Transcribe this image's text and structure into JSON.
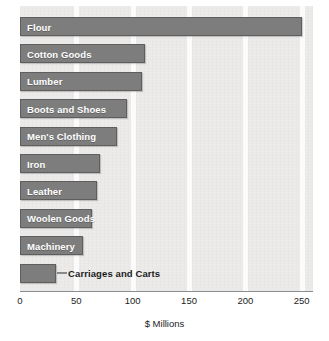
{
  "chart_data": {
    "type": "bar",
    "orientation": "horizontal",
    "title": "",
    "xlabel": "$ Millions",
    "ylabel": "",
    "xlim": [
      0,
      260
    ],
    "xticks": [
      0,
      50,
      100,
      150,
      200,
      250
    ],
    "xtick_labels": [
      "0",
      "50",
      "100",
      "150",
      "200",
      "250"
    ],
    "grid": true,
    "grid_axis": "x",
    "legend": "none",
    "bar_color": "#7d7d7d",
    "bar_border_color": "#5e5e5e",
    "plot_background": "#ecebea",
    "label_color_inside": "#ffffff",
    "label_color_outside": "#1c1c1c",
    "categories": [
      "Flour",
      "Cotton Goods",
      "Lumber",
      "Boots and Shoes",
      "Men's Clothing",
      "Iron",
      "Leather",
      "Woolen Goods",
      "Machinery",
      "Carriages and Carts"
    ],
    "values": [
      250,
      111,
      108,
      95,
      86,
      71,
      68,
      64,
      56,
      32
    ],
    "bars": [
      {
        "label": "Flour",
        "value": 250,
        "label_position": "inside"
      },
      {
        "label": "Cotton Goods",
        "value": 111,
        "label_position": "inside"
      },
      {
        "label": "Lumber",
        "value": 108,
        "label_position": "inside"
      },
      {
        "label": "Boots and Shoes",
        "value": 95,
        "label_position": "inside"
      },
      {
        "label": "Men's Clothing",
        "value": 86,
        "label_position": "inside"
      },
      {
        "label": "Iron",
        "value": 71,
        "label_position": "inside"
      },
      {
        "label": "Leather",
        "value": 68,
        "label_position": "inside"
      },
      {
        "label": "Woolen Goods",
        "value": 64,
        "label_position": "inside"
      },
      {
        "label": "Machinery",
        "value": 56,
        "label_position": "inside"
      },
      {
        "label": "Carriages and Carts",
        "value": 32,
        "label_position": "outside"
      }
    ]
  }
}
